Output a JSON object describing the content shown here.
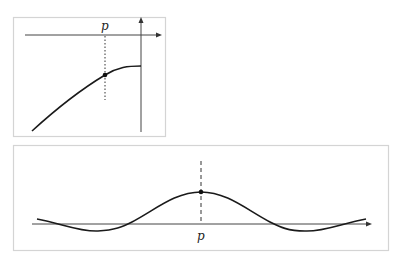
{
  "figure": {
    "top_panel": {
      "point_label": "p",
      "description": "Curve approaching a plateau with marked point p; horizontal and vertical axes with arrows"
    },
    "bottom_panel": {
      "point_label": "p",
      "description": "Bump-shaped curve with peak at p, oscillating about the horizontal axis"
    }
  },
  "colors": {
    "frame": "#d4d4d4",
    "curve": "#1a1a1a",
    "axis": "#444444"
  }
}
